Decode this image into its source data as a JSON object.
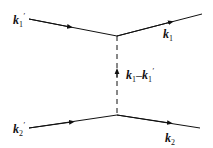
{
  "diagram": {
    "type": "feynman",
    "labels": {
      "k1_prime": {
        "base": "k",
        "sub": "1",
        "sup": "′"
      },
      "k1": {
        "base": "k",
        "sub": "1"
      },
      "k2_prime": {
        "base": "k",
        "sub": "2",
        "sup": "′"
      },
      "k2": {
        "base": "k",
        "sub": "2"
      },
      "exchange": {
        "a": "k",
        "a_sub": "1",
        "dash": "–",
        "b": "k",
        "b_sub": "1",
        "b_sup": "′"
      }
    },
    "line_color": "#111111"
  }
}
